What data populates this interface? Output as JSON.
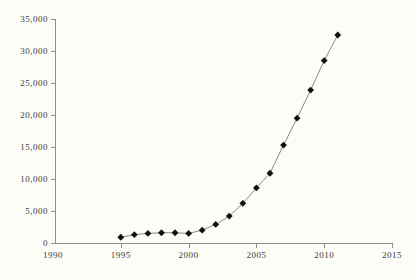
{
  "chart_data": {
    "type": "line",
    "title": "",
    "subtitle": "",
    "caption": "",
    "xlabel": "",
    "ylabel": "",
    "xlim": [
      1990,
      2015
    ],
    "ylim": [
      0,
      35000
    ],
    "grid": false,
    "legend": "none",
    "marker": "diamond",
    "marker_color": "#111111",
    "line_color": "#8a8a84",
    "background_color": "#fdfdf7",
    "axis_color": "#8f8f88",
    "x_ticks": [
      1990,
      1995,
      2000,
      2005,
      2010,
      2015
    ],
    "x_tick_labels": [
      "1990",
      "1995",
      "2000",
      "2005",
      "2010",
      "2015"
    ],
    "y_ticks": [
      0,
      5000,
      10000,
      15000,
      20000,
      25000,
      30000,
      35000
    ],
    "y_tick_labels": [
      "0",
      "5,000",
      "10,000",
      "15,000",
      "20,000",
      "25,000",
      "30,000",
      "35,000"
    ],
    "x": [
      1995,
      1996,
      1997,
      1998,
      1999,
      2000,
      2001,
      2002,
      2003,
      2004,
      2005,
      2006,
      2007,
      2008,
      2009,
      2010,
      2011
    ],
    "values": [
      900,
      1300,
      1500,
      1600,
      1600,
      1500,
      2000,
      2900,
      4200,
      6200,
      8600,
      10900,
      15300,
      19500,
      23900,
      28500,
      32500
    ],
    "series": [
      {
        "name": "series-1",
        "values": [
          900,
          1300,
          1500,
          1600,
          1600,
          1500,
          2000,
          2900,
          4200,
          6200,
          8600,
          10900,
          15300,
          19500,
          23900,
          28500,
          32500
        ]
      }
    ]
  }
}
